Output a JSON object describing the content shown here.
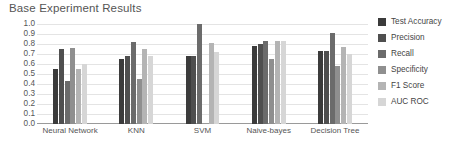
{
  "chart_data": {
    "type": "bar",
    "title": "Base Experiment Results",
    "xlabel": "",
    "ylabel": "",
    "ylim": [
      0,
      1.0
    ],
    "grid": true,
    "legend_position": "right",
    "categories": [
      "Neural Network",
      "KNN",
      "SVM",
      "Naive-bayes",
      "Decision Tree"
    ],
    "ytick_labels": [
      "1.0",
      "0.9",
      "0.8",
      "0.7",
      "0.6",
      "0.5",
      "0.4",
      "0.3",
      "0.2",
      "0.1",
      "0.0"
    ],
    "ytick_values": [
      1.0,
      0.9,
      0.8,
      0.7,
      0.6,
      0.5,
      0.4,
      0.3,
      0.2,
      0.1,
      0.0
    ],
    "series": [
      {
        "name": "Test Accuracy",
        "color": "#3b3b3b",
        "values": [
          0.55,
          0.65,
          0.68,
          0.78,
          0.73
        ]
      },
      {
        "name": "Precision",
        "color": "#4f4f4f",
        "values": [
          0.75,
          0.68,
          0.68,
          0.8,
          0.73
        ]
      },
      {
        "name": "Recall",
        "color": "#6b6b6b",
        "values": [
          0.43,
          0.82,
          1.0,
          0.83,
          0.91
        ]
      },
      {
        "name": "Specificity",
        "color": "#8f8f8f",
        "values": [
          0.76,
          0.45,
          0.0,
          0.65,
          0.58
        ]
      },
      {
        "name": "F1 Score",
        "color": "#b4b4b4",
        "values": [
          0.55,
          0.75,
          0.81,
          0.83,
          0.77
        ]
      },
      {
        "name": "AUC ROC",
        "color": "#d6d6d6",
        "values": [
          0.6,
          0.68,
          0.72,
          0.83,
          0.7
        ]
      }
    ]
  }
}
